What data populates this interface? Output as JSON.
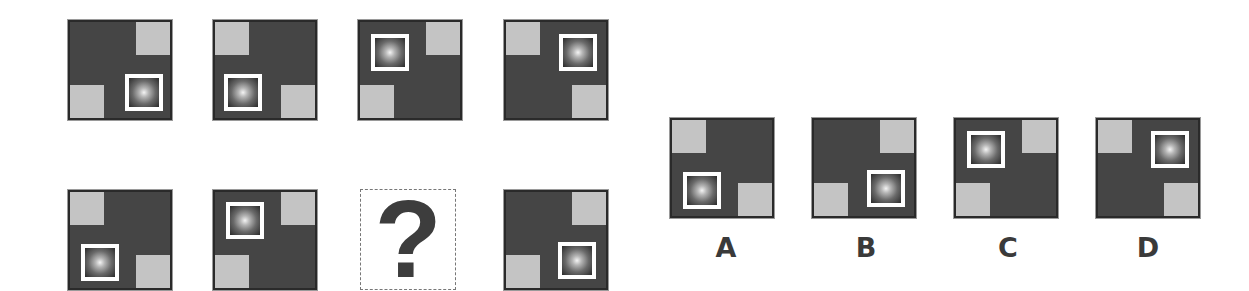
{
  "puzzle": {
    "missing_marker": "?",
    "colors": {
      "tile_background": "#454545",
      "corner_square": "#c4c4c4",
      "light_frame": "#ffffff",
      "label_text": "#3a3a3a"
    },
    "sequence_row_1": [
      {
        "gray_corners": [
          "top-right",
          "bottom-left"
        ],
        "light_position": "bottom-right"
      },
      {
        "gray_corners": [
          "top-left",
          "bottom-right"
        ],
        "light_position": "bottom-left"
      },
      {
        "gray_corners": [
          "top-right",
          "bottom-left"
        ],
        "light_position": "top-left"
      },
      {
        "gray_corners": [
          "top-left",
          "bottom-right"
        ],
        "light_position": "top-right"
      }
    ],
    "sequence_row_2": [
      {
        "gray_corners": [
          "top-left",
          "bottom-right"
        ],
        "light_position": "bottom-left"
      },
      {
        "gray_corners": [
          "top-right",
          "bottom-left"
        ],
        "light_position": "top-left"
      },
      {
        "missing": true
      },
      {
        "gray_corners": [
          "top-right",
          "bottom-left"
        ],
        "light_position": "bottom-right"
      }
    ],
    "options": [
      {
        "label": "A",
        "gray_corners": [
          "top-left",
          "bottom-right"
        ],
        "light_position": "bottom-left"
      },
      {
        "label": "B",
        "gray_corners": [
          "top-right",
          "bottom-left"
        ],
        "light_position": "bottom-right"
      },
      {
        "label": "C",
        "gray_corners": [
          "top-right",
          "bottom-left"
        ],
        "light_position": "top-left"
      },
      {
        "label": "D",
        "gray_corners": [
          "top-left",
          "bottom-right"
        ],
        "light_position": "top-right"
      }
    ]
  }
}
